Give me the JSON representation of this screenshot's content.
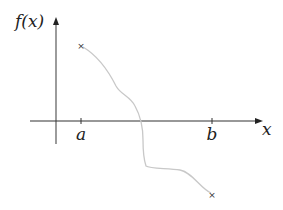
{
  "diagram": {
    "y_axis_label": "f(x)",
    "x_axis_label": "x",
    "ticks": [
      {
        "label": "a",
        "x": 81
      },
      {
        "label": "b",
        "x": 212
      }
    ],
    "endpoints": [
      {
        "name": "start",
        "marker": "×",
        "x": 81,
        "y": 45
      },
      {
        "name": "end",
        "marker": "×",
        "x": 212,
        "y": 194
      }
    ],
    "colors": {
      "axis": "#333333",
      "y_axis": "#666666",
      "curve": "#c8c8c8",
      "text": "#222222"
    }
  }
}
